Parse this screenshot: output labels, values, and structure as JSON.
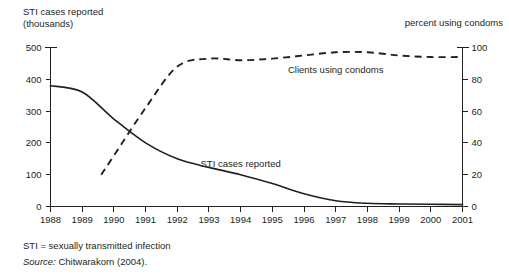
{
  "figure": {
    "left_axis_caption": "STI cases reported\n(thousands)",
    "right_axis_caption": "percent using condoms",
    "footnote_definition": "STI = sexually transmitted infection",
    "source_prefix": "Source:",
    "source_text": "Chitwarakorn (2004)."
  },
  "chart_data": {
    "type": "line",
    "title": "",
    "xlabel": "",
    "ylabel": "STI cases reported (thousands)",
    "y2label": "percent using condoms",
    "grid": false,
    "legend": "inline-annotations",
    "x": [
      1988,
      1989,
      1990,
      1991,
      1992,
      1993,
      1994,
      1995,
      1996,
      1997,
      1998,
      1999,
      2000,
      2001
    ],
    "xlim": [
      1988,
      2001
    ],
    "xticks": [
      "1988",
      "1989",
      "1990",
      "1991",
      "1992",
      "1993",
      "1994",
      "1995",
      "1996",
      "1997",
      "1998",
      "1999",
      "2000",
      "2001"
    ],
    "ylim": [
      0,
      500
    ],
    "yticks": [
      "0",
      "100",
      "200",
      "300",
      "400",
      "500"
    ],
    "y2lim": [
      0,
      100
    ],
    "y2ticks": [
      "0",
      "20",
      "40",
      "60",
      "80",
      "100"
    ],
    "series": [
      {
        "name": "STI cases reported",
        "style": "solid",
        "axis": "left",
        "units": "thousands",
        "label_x": 1994.0,
        "label_y": 125,
        "x": [
          1988,
          1989,
          1990,
          1991,
          1992,
          1993,
          1994,
          1995,
          1996,
          1997,
          1998,
          1999,
          2000,
          2001
        ],
        "values": [
          380,
          360,
          275,
          200,
          150,
          123,
          100,
          72,
          40,
          18,
          10,
          8,
          7,
          6
        ]
      },
      {
        "name": "Clients using condoms",
        "style": "dashed",
        "axis": "right",
        "units": "percent",
        "label_x": 1997.0,
        "label_y": 84,
        "x": [
          1989.6,
          1990,
          1991,
          1992,
          1993,
          1994,
          1995,
          1996,
          1997,
          1998,
          1999,
          2000,
          2001
        ],
        "values": [
          20,
          32,
          62,
          88,
          93,
          92,
          93,
          95,
          97,
          97,
          95,
          94,
          94
        ]
      }
    ]
  }
}
